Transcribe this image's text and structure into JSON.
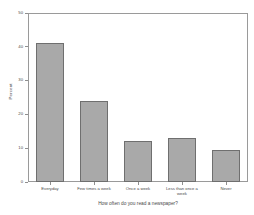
{
  "chart_data": {
    "type": "bar",
    "title": "",
    "subtitle": "",
    "xlabel": "How often do you read a newspaper?",
    "ylabel": "Percent",
    "categories": [
      "Everyday",
      "Few times a week",
      "Once a week",
      "Less than once a week",
      "Never"
    ],
    "values": [
      41,
      24,
      12,
      13,
      9.5
    ],
    "ylim": [
      0,
      50
    ],
    "yticks": [
      0,
      10,
      20,
      30,
      40,
      50
    ],
    "ytick_labels": [
      "0",
      "10",
      "20",
      "30",
      "40",
      "50"
    ],
    "grid": false,
    "legend": null,
    "bar_color": "#a9a9a9",
    "bar_edge_color": "#6f6f6f",
    "frame_color": "#9a9a9a",
    "background": "#ffffff"
  }
}
